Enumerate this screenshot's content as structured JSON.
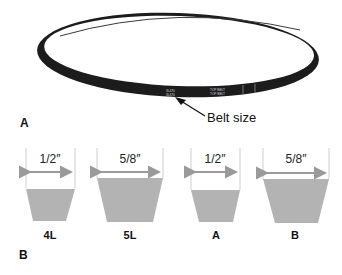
{
  "panel_a": {
    "label": "A",
    "callout": "Belt size",
    "belt_print": [
      "3L470",
      "3L470"
    ],
    "belt_print_right": [
      "TOP BELT",
      "TOP BELT"
    ]
  },
  "panel_b": {
    "label": "B",
    "sections": [
      {
        "name": "4L",
        "width": "1/2″"
      },
      {
        "name": "5L",
        "width": "5/8″"
      },
      {
        "name": "A",
        "width": "1/2″"
      },
      {
        "name": "B",
        "width": "5/8″"
      }
    ]
  },
  "colors": {
    "belt": "#1c1c1c",
    "section_fill": "#b3b3b3",
    "arrow": "#9a9a9a",
    "guide_line": "#cfcfcf"
  }
}
